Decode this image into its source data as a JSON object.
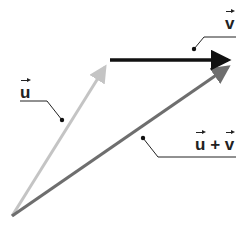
{
  "diagram": {
    "labels": {
      "u": "u",
      "v": "v",
      "sum_left": "u",
      "sum_op": "+",
      "sum_right": "v"
    },
    "vectors": [
      {
        "name": "u",
        "from": [
          12,
          216
        ],
        "to": [
          110,
          60
        ],
        "color": "#c4c4c4"
      },
      {
        "name": "v",
        "from": [
          110,
          60
        ],
        "to": [
          236,
          60
        ],
        "color": "#111111"
      },
      {
        "name": "u+v",
        "from": [
          12,
          216
        ],
        "to": [
          236,
          62
        ],
        "color": "#6e6e6e"
      }
    ]
  }
}
